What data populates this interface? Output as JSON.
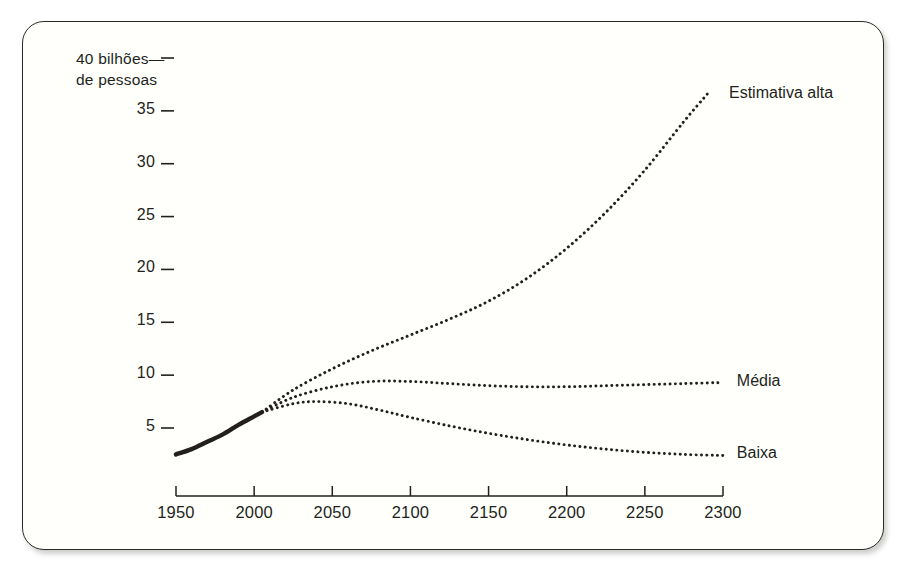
{
  "figure": {
    "background_color": "#fffffb",
    "border_color": "#2a2a28",
    "ink_color": "#231f1c"
  },
  "chart_data": {
    "type": "line",
    "title": "",
    "subtitle": "",
    "xlabel": "",
    "ylabel": "40 bilhões de pessoas",
    "ylabel_line1": "40 bilhões—",
    "ylabel_line2": "de pessoas",
    "xlim": [
      1950,
      2300
    ],
    "ylim": [
      0,
      40
    ],
    "grid": false,
    "legend_position": "right-inline",
    "x_ticks": [
      1950,
      2000,
      2050,
      2100,
      2150,
      2200,
      2250,
      2300
    ],
    "x_tick_labels": [
      "1950",
      "2000",
      "2050",
      "2100",
      "2150",
      "2200",
      "2250",
      "2300"
    ],
    "y_ticks": [
      5,
      10,
      15,
      20,
      25,
      30,
      35,
      40
    ],
    "y_tick_labels": [
      "5",
      "10",
      "15",
      "20",
      "25",
      "30",
      "35",
      "40"
    ],
    "series": [
      {
        "name": "Histórico",
        "label": "",
        "style": "solid",
        "x": [
          1950,
          1960,
          1970,
          1980,
          1990,
          2000,
          2005
        ],
        "values": [
          2.5,
          3.0,
          3.7,
          4.4,
          5.3,
          6.1,
          6.5
        ]
      },
      {
        "name": "Estimativa alta",
        "label": "Estimativa alta",
        "style": "dotted",
        "x": [
          2005,
          2025,
          2050,
          2075,
          2100,
          2125,
          2150,
          2175,
          2200,
          2225,
          2250,
          2275,
          2290
        ],
        "values": [
          6.5,
          8.6,
          10.6,
          12.3,
          13.8,
          15.3,
          17.0,
          19.2,
          22.0,
          25.4,
          29.4,
          34.0,
          36.6
        ]
      },
      {
        "name": "Média",
        "label": "Média",
        "style": "dotted",
        "x": [
          2005,
          2025,
          2050,
          2075,
          2100,
          2125,
          2150,
          2175,
          2200,
          2225,
          2250,
          2275,
          2300
        ],
        "values": [
          6.5,
          7.9,
          8.9,
          9.4,
          9.4,
          9.2,
          9.0,
          8.9,
          8.9,
          9.0,
          9.1,
          9.2,
          9.3
        ]
      },
      {
        "name": "Baixa",
        "label": "Baixa",
        "style": "dotted",
        "x": [
          2005,
          2025,
          2040,
          2060,
          2080,
          2100,
          2125,
          2150,
          2175,
          2200,
          2225,
          2250,
          2275,
          2300
        ],
        "values": [
          6.5,
          7.3,
          7.5,
          7.3,
          6.7,
          6.0,
          5.2,
          4.5,
          3.9,
          3.4,
          3.0,
          2.7,
          2.5,
          2.4
        ]
      }
    ],
    "annotations": [
      {
        "text": "Estimativa alta",
        "x": 2300,
        "y": 36.5
      },
      {
        "text": "Média",
        "x": 2305,
        "y": 9.3
      },
      {
        "text": "Baixa",
        "x": 2305,
        "y": 2.4
      }
    ]
  }
}
